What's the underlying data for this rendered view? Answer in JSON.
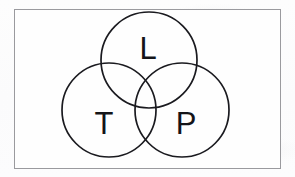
{
  "figure": {
    "kind": "venn-diagram",
    "set_count": 3,
    "background_color": "#fdfdfd",
    "stroke_color": "#1a1a1f",
    "frame": {
      "name": "outer-frame",
      "x": 14,
      "y": 9,
      "width": 266,
      "height": 159,
      "border_color": "#9a9a9e",
      "border_width": 1,
      "fill": "#fefefe"
    },
    "circles": [
      {
        "id": "L",
        "label": "L",
        "cx": 149,
        "cy": 60,
        "r": 48,
        "label_x": 148,
        "label_y": 48
      },
      {
        "id": "T",
        "label": "T",
        "cx": 109,
        "cy": 110,
        "r": 47,
        "label_x": 104,
        "label_y": 123
      },
      {
        "id": "P",
        "label": "P",
        "cx": 182,
        "cy": 110,
        "r": 47,
        "label_x": 186,
        "label_y": 123
      }
    ]
  }
}
